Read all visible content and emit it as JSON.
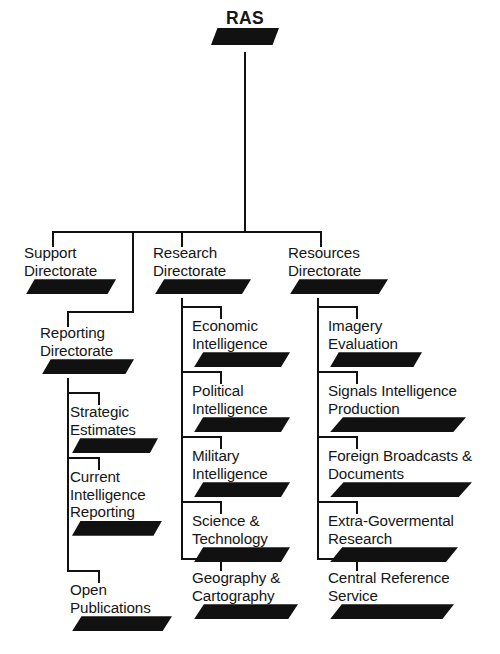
{
  "chart": {
    "title": "RAS",
    "type": "organizational-chart",
    "root": {
      "id": "ras",
      "label": "RAS"
    },
    "directorates": [
      {
        "id": "support-directorate",
        "label": "Support\nDirectorate",
        "children": []
      },
      {
        "id": "reporting-directorate",
        "label": "Reporting\nDirectorate",
        "children": [
          {
            "id": "strategic-estimates",
            "label": "Strategic\nEstimates"
          },
          {
            "id": "current-intelligence-reporting",
            "label": "Current\nIntelligence\nReporting"
          },
          {
            "id": "open-publications",
            "label": "Open\nPublications"
          }
        ]
      },
      {
        "id": "research-directorate",
        "label": "Research\nDirectorate",
        "children": [
          {
            "id": "economic-intelligence",
            "label": "Economic\nIntelligence"
          },
          {
            "id": "political-intelligence",
            "label": "Political\nIntelligence"
          },
          {
            "id": "military-intelligence",
            "label": "Military\nIntelligence"
          },
          {
            "id": "science-technology",
            "label": "Science &\nTechnology"
          },
          {
            "id": "geography-cartography",
            "label": "Geography &\nCartography"
          }
        ]
      },
      {
        "id": "resources-directorate",
        "label": "Resources\nDirectorate",
        "children": [
          {
            "id": "imagery-evaluation",
            "label": "Imagery\nEvaluation"
          },
          {
            "id": "signals-intelligence-production",
            "label": "Signals Intelligence\nProduction"
          },
          {
            "id": "foreign-broadcasts-documents",
            "label": "Foreign Broadcasts &\nDocuments"
          },
          {
            "id": "extra-govermental-research",
            "label": "Extra-Govermental\nResearch"
          },
          {
            "id": "central-reference-service",
            "label": "Central Reference\nService"
          }
        ]
      }
    ],
    "colors": {
      "line": "#111111",
      "bar": "#111111",
      "text": "#161616",
      "background": "#ffffff"
    }
  }
}
